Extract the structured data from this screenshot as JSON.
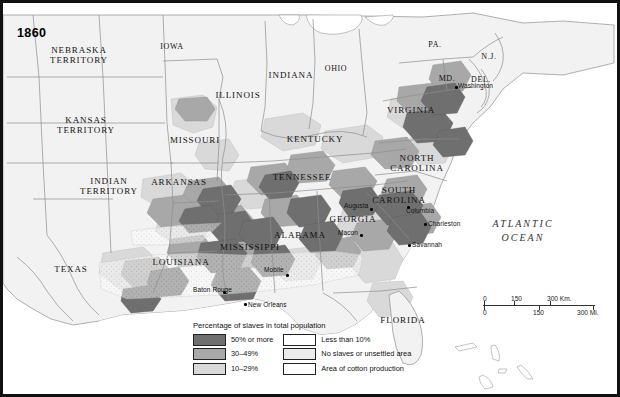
{
  "map": {
    "year_label": "1860",
    "ocean_label": "ATLANTIC\nOCEAN",
    "states": [
      {
        "name": "NEBRASKA\nTERRITORY",
        "x": 76,
        "y": 42
      },
      {
        "name": "KANSAS\nTERRITORY",
        "x": 83,
        "y": 112
      },
      {
        "name": "INDIAN\nTERRITORY",
        "x": 106,
        "y": 173
      },
      {
        "name": "TEXAS",
        "x": 68,
        "y": 262
      },
      {
        "name": "IOWA",
        "x": 169,
        "y": 40
      },
      {
        "name": "MISSOURI",
        "x": 192,
        "y": 133
      },
      {
        "name": "ARKANSAS",
        "x": 176,
        "y": 175
      },
      {
        "name": "LOUISIANA",
        "x": 178,
        "y": 255
      },
      {
        "name": "ILLINOIS",
        "x": 235,
        "y": 88
      },
      {
        "name": "INDIANA",
        "x": 288,
        "y": 68
      },
      {
        "name": "OHIO",
        "x": 333,
        "y": 62
      },
      {
        "name": "KENTUCKY",
        "x": 312,
        "y": 132
      },
      {
        "name": "TENNESSEE",
        "x": 299,
        "y": 170
      },
      {
        "name": "MISSISSIPPI",
        "x": 247,
        "y": 240
      },
      {
        "name": "ALABAMA",
        "x": 297,
        "y": 228
      },
      {
        "name": "GEORGIA",
        "x": 350,
        "y": 212
      },
      {
        "name": "FLORIDA",
        "x": 400,
        "y": 313
      },
      {
        "name": "SOUTH\nCAROLINA",
        "x": 396,
        "y": 182
      },
      {
        "name": "NORTH\nCAROLINA",
        "x": 414,
        "y": 150
      },
      {
        "name": "VIRGINIA",
        "x": 408,
        "y": 103
      },
      {
        "name": "PA.",
        "x": 432,
        "y": 38
      },
      {
        "name": "N.J.",
        "x": 486,
        "y": 50
      },
      {
        "name": "MD.",
        "x": 444,
        "y": 72
      },
      {
        "name": "DEL.",
        "x": 478,
        "y": 73
      }
    ],
    "cities": [
      {
        "name": "Washington",
        "x": 452,
        "y": 83,
        "dx": 3,
        "dy": -3
      },
      {
        "name": "Columbia",
        "x": 404,
        "y": 203,
        "dx": -1,
        "dy": 2
      },
      {
        "name": "Charleston",
        "x": 421,
        "y": 220,
        "dx": 4,
        "dy": -2
      },
      {
        "name": "Savannah",
        "x": 405,
        "y": 241,
        "dx": 4,
        "dy": -2
      },
      {
        "name": "Augusta",
        "x": 367,
        "y": 205,
        "dx": -26,
        "dy": -5
      },
      {
        "name": "Macon",
        "x": 357,
        "y": 231,
        "dx": -22,
        "dy": -4
      },
      {
        "name": "Mobile",
        "x": 283,
        "y": 271,
        "dx": -22,
        "dy": -7
      },
      {
        "name": "New Orleans",
        "x": 241,
        "y": 300,
        "dx": 4,
        "dy": -1
      },
      {
        "name": "Baton Rouge",
        "x": 220,
        "y": 288,
        "dx": -30,
        "dy": -4
      }
    ]
  },
  "legend": {
    "title": "Percentage of slaves\nin total population",
    "left_items": [
      {
        "label": "50% or more",
        "swatch": "sw-50"
      },
      {
        "label": "30–49%",
        "swatch": "sw-30"
      },
      {
        "label": "10–29%",
        "swatch": "sw-10"
      }
    ],
    "right_items": [
      {
        "label": "Less than 10%",
        "swatch": "sw-lt"
      },
      {
        "label": "No slaves or\nunsettled area",
        "swatch": "sw-no"
      },
      {
        "label": "Area of cotton\nproduction",
        "swatch": "sw-cot"
      }
    ]
  },
  "scale": {
    "km": [
      "0",
      "150",
      "300 Km."
    ],
    "mi": [
      "0",
      "150",
      "300 Mi."
    ]
  },
  "colors": {
    "dark": "#6f6f6f",
    "medium": "#a8a8a8",
    "light": "#d9d9d9",
    "none": "#ececec",
    "water": "#ffffff",
    "border": "#111111"
  }
}
